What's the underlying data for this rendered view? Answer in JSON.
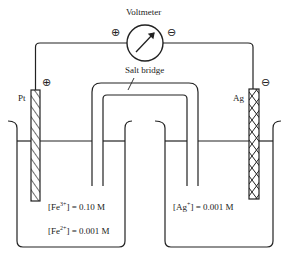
{
  "diagram": {
    "type": "galvanic-cell",
    "voltmeter_label": "Voltmeter",
    "voltmeter_plus": "⊕",
    "voltmeter_minus": "⊖",
    "salt_bridge_label": "Salt bridge",
    "left_electrode": {
      "label": "Pt",
      "polarity": "⊕"
    },
    "right_electrode": {
      "label": "Ag",
      "polarity": "⊖"
    },
    "left_solution": {
      "fe3_prefix": "[Fe",
      "fe3_charge": "3+",
      "fe3_value": "] = 0.10 M",
      "fe2_prefix": "[Fe",
      "fe2_charge": "2+",
      "fe2_value": "] = 0.001 M"
    },
    "right_solution": {
      "ag_prefix": "[Ag",
      "ag_charge": "+",
      "ag_value": "] = 0.001 M"
    }
  }
}
